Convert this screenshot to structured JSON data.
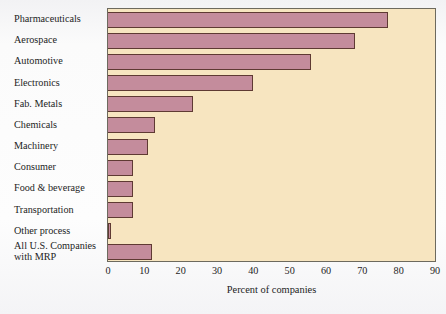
{
  "chart_data": {
    "type": "bar",
    "orientation": "horizontal",
    "title": "",
    "xlabel": "Percent of companies",
    "ylabel": "",
    "xlim": [
      0,
      90
    ],
    "xticks": [
      0,
      10,
      20,
      30,
      40,
      50,
      60,
      70,
      80,
      90
    ],
    "xtick_labels": [
      "0",
      "10",
      "20",
      "30",
      "40",
      "50",
      "60",
      "70",
      "80",
      "90"
    ],
    "grid": false,
    "legend": null,
    "categories": [
      "Pharmaceuticals",
      "Aerospace",
      "Automotive",
      "Electronics",
      "Fab. Metals",
      "Chemicals",
      "Machinery",
      "Consumer",
      "Food & beverage",
      "Transportation",
      "Other process",
      "All U.S. Companies\nwith MRP"
    ],
    "values": [
      77,
      68,
      56,
      40,
      23.5,
      13,
      11,
      7,
      7,
      7,
      0.7,
      12
    ],
    "bar_color": "#c48c9c",
    "bar_edge_color": "#5f3a33",
    "plot_background": "#f7e5c0"
  }
}
